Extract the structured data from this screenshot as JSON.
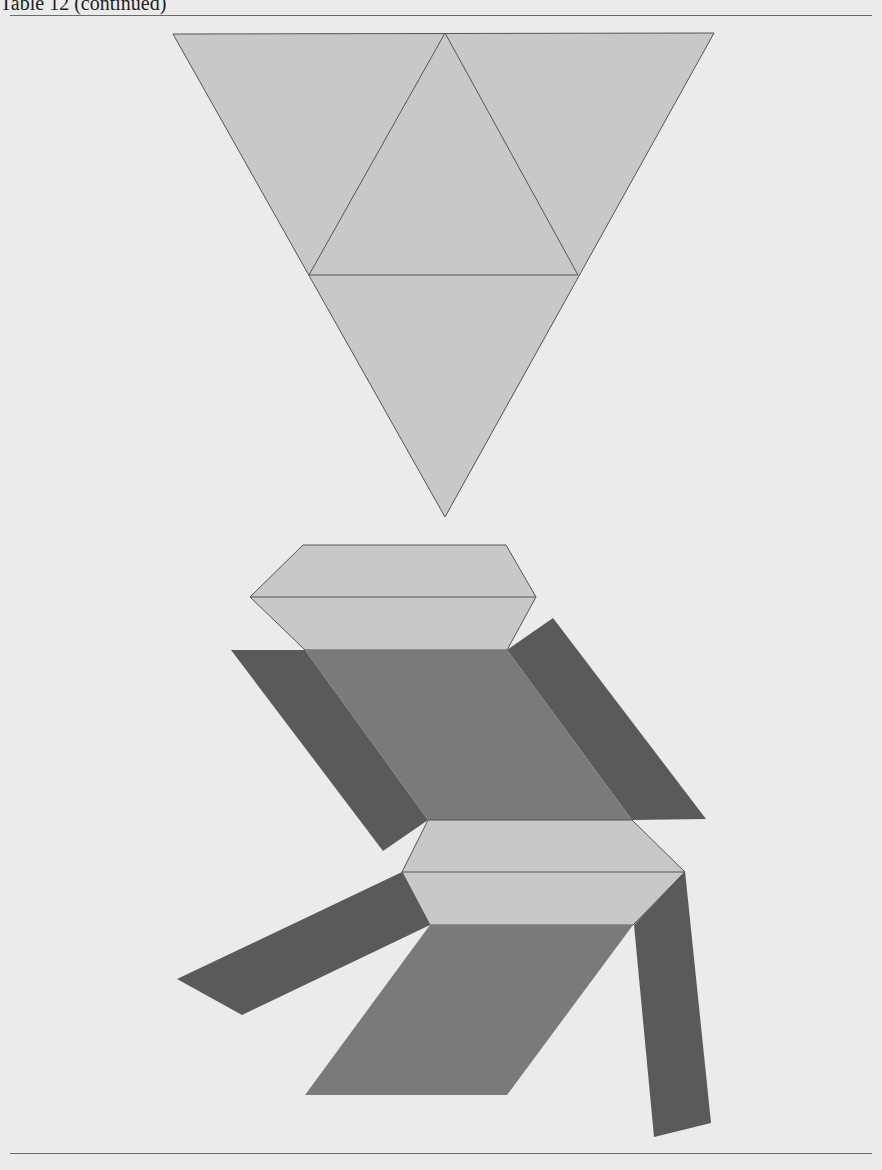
{
  "header": {
    "title": "Table 12",
    "subtitle": "(continued)"
  },
  "figure": {
    "colors": {
      "light_face": "#c8c8c8",
      "mid_face": "#7a7a7a",
      "dark_face": "#5a5a5a",
      "edge": "#555555",
      "background": "#ebebeb"
    },
    "triangle_net": {
      "outer": [
        [
          173,
          34
        ],
        [
          714,
          33
        ],
        [
          445,
          517
        ]
      ],
      "inner_edges": [
        [
          [
            445,
            33
          ],
          [
            309,
            275
          ]
        ],
        [
          [
            445,
            33
          ],
          [
            578,
            275
          ]
        ],
        [
          [
            309,
            275
          ],
          [
            578,
            275
          ]
        ]
      ]
    },
    "prism_net": {
      "upper_hexagon": [
        [
          303,
          545
        ],
        [
          506,
          545
        ],
        [
          536,
          597
        ],
        [
          507,
          650
        ],
        [
          305,
          650
        ],
        [
          250,
          597
        ]
      ],
      "upper_hexagon_midline": [
        [
          250,
          597
        ],
        [
          536,
          597
        ]
      ],
      "upper_rhombus": [
        [
          305,
          650
        ],
        [
          507,
          650
        ],
        [
          632,
          820
        ],
        [
          428,
          820
        ]
      ],
      "left_flap_upper": [
        [
          231,
          650
        ],
        [
          305,
          650
        ],
        [
          428,
          820
        ],
        [
          383,
          851
        ]
      ],
      "right_flap_upper": [
        [
          507,
          650
        ],
        [
          553,
          618
        ],
        [
          706,
          819
        ],
        [
          632,
          820
        ]
      ],
      "lower_hexagon": [
        [
          428,
          820
        ],
        [
          632,
          820
        ],
        [
          685,
          872
        ],
        [
          633,
          925
        ],
        [
          430,
          925
        ],
        [
          402,
          872
        ]
      ],
      "lower_hexagon_midline": [
        [
          402,
          872
        ],
        [
          685,
          872
        ]
      ],
      "lower_rhombus": [
        [
          430,
          925
        ],
        [
          633,
          925
        ],
        [
          507,
          1095
        ],
        [
          305,
          1095
        ]
      ],
      "left_arm": [
        [
          402,
          872
        ],
        [
          430,
          925
        ],
        [
          242,
          1015
        ],
        [
          177,
          979
        ]
      ],
      "right_arm": [
        [
          685,
          871
        ],
        [
          711,
          1123
        ],
        [
          654,
          1137
        ],
        [
          634,
          925
        ]
      ]
    }
  }
}
